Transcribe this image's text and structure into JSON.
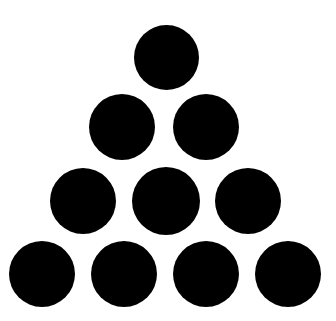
{
  "figure": {
    "type": "dot-pattern",
    "shape_name": "triangle",
    "total_dots": 10,
    "rows": 4,
    "background_color": "#ffffff",
    "dot_color": "#000000",
    "canvas": {
      "width": 336,
      "height": 321
    }
  },
  "pattern_data": {
    "type": "scatter",
    "dot_diameter": 65,
    "row_counts": [
      1,
      2,
      3,
      4
    ],
    "rows": [
      {
        "index": 1,
        "count": 1,
        "center_y": 57,
        "dots": [
          {
            "id": "dot-1",
            "cx": 166,
            "cy": 57,
            "d": 65
          }
        ]
      },
      {
        "index": 2,
        "count": 2,
        "center_y": 127,
        "dots": [
          {
            "id": "dot-2",
            "cx": 122,
            "cy": 127,
            "d": 66
          },
          {
            "id": "dot-3",
            "cx": 206,
            "cy": 127,
            "d": 66
          }
        ]
      },
      {
        "index": 3,
        "count": 3,
        "center_y": 201,
        "dots": [
          {
            "id": "dot-4",
            "cx": 83,
            "cy": 201,
            "d": 66
          },
          {
            "id": "dot-5",
            "cx": 166,
            "cy": 201,
            "d": 68
          },
          {
            "id": "dot-6",
            "cx": 248,
            "cy": 201,
            "d": 66
          }
        ]
      },
      {
        "index": 4,
        "count": 4,
        "center_y": 274,
        "dots": [
          {
            "id": "dot-7",
            "cx": 42,
            "cy": 274,
            "d": 66
          },
          {
            "id": "dot-8",
            "cx": 124,
            "cy": 274,
            "d": 66
          },
          {
            "id": "dot-9",
            "cx": 206,
            "cy": 274,
            "d": 66
          },
          {
            "id": "dot-10",
            "cx": 288,
            "cy": 274,
            "d": 66
          }
        ]
      }
    ]
  }
}
